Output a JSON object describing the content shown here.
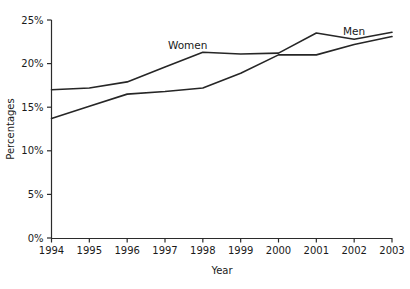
{
  "chart_data": {
    "type": "line",
    "title": "",
    "xlabel": "Year",
    "ylabel": "Percentages",
    "x": [
      1994,
      1995,
      1996,
      1997,
      1998,
      1999,
      2000,
      2001,
      2002,
      2003
    ],
    "xtick_labels": [
      "1994",
      "1995",
      "1996",
      "1997",
      "1998",
      "1999",
      "2000",
      "2001",
      "2002",
      "2003"
    ],
    "ytick_labels": [
      "0%",
      "5%",
      "10%",
      "15%",
      "20%",
      "25%"
    ],
    "ytick_values": [
      0,
      5,
      10,
      15,
      20,
      25
    ],
    "ylim": [
      0,
      25
    ],
    "xlim": [
      1994,
      2003
    ],
    "grid": false,
    "legend_position": "inline-annotations",
    "series": [
      {
        "name": "Women",
        "label": "Women",
        "color": "#262626",
        "values": [
          17.0,
          17.2,
          17.9,
          19.6,
          21.3,
          21.1,
          21.2,
          23.5,
          22.8,
          23.6
        ]
      },
      {
        "name": "Men",
        "label": "Men",
        "color": "#262626",
        "values": [
          13.7,
          15.1,
          16.5,
          16.8,
          17.2,
          18.9,
          21.0,
          21.0,
          22.2,
          23.1
        ]
      }
    ],
    "annotations": [
      {
        "text": "Women",
        "series": "Women",
        "near_x": 1997.6
      },
      {
        "text": "Men",
        "series": "Men",
        "near_x": 2002.0
      }
    ]
  },
  "axes": {
    "y_axis_title": "Percentages",
    "x_axis_title": "Year"
  }
}
